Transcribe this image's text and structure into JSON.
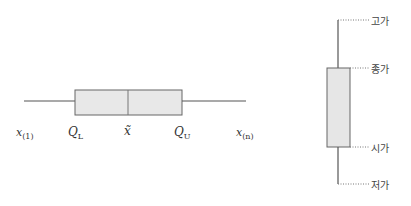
{
  "boxplot": {
    "labels": {
      "min": "x",
      "min_sub": "(1)",
      "q_lower": "Q",
      "q_lower_sub": "L",
      "median": "x̃",
      "q_upper": "Q",
      "q_upper_sub": "U",
      "max": "x",
      "max_sub": "(n)"
    },
    "colors": {
      "box_fill": "#e8e8e8",
      "line": "#555555"
    }
  },
  "candlestick": {
    "labels": {
      "high": "고가",
      "close": "종가",
      "open": "시가",
      "low": "저가"
    },
    "colors": {
      "body_fill": "#e6e6e6",
      "line": "#555555",
      "leader": "#777777"
    }
  }
}
